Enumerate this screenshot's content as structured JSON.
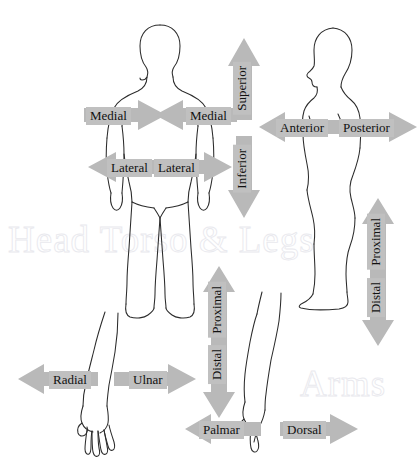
{
  "diagram": {
    "watermarks": [
      {
        "id": "head-torso-legs",
        "text": "Head Torso & Legs"
      },
      {
        "id": "arms",
        "text": "Arms"
      }
    ],
    "colors": {
      "arrow_fill": "#b9b9b9",
      "label_background": "#c0c0c0",
      "label_text": "#111111",
      "body_outline": "#2b2b2b",
      "watermark_outline": "#e9e9ee",
      "page_background": "#ffffff"
    }
  },
  "figures": [
    {
      "id": "anterior-body-figure",
      "name": "front-view-human-body",
      "view": "anterior"
    },
    {
      "id": "lateral-body-figure",
      "name": "side-view-human-body",
      "view": "lateral"
    },
    {
      "id": "left-arm-figure",
      "name": "arm-palmar-view",
      "view": "palmar"
    },
    {
      "id": "right-arm-figure",
      "name": "arm-dorsal-view",
      "view": "dorsal"
    }
  ],
  "labels": {
    "medial_left": "Medial",
    "medial_right": "Medial",
    "lateral_left": "Lateral",
    "lateral_right": "Lateral",
    "superior": "Superior",
    "inferior": "Inferior",
    "anterior": "Anterior",
    "posterior": "Posterior",
    "proximal_leg": "Proximal",
    "distal_leg": "Distal",
    "proximal_arm": "Proximal",
    "distal_arm": "Distal",
    "radial": "Radial",
    "ulnar": "Ulnar",
    "palmar": "Palmar",
    "dorsal": "Dorsal"
  },
  "arrows": [
    {
      "name": "medial-left-arrow",
      "label": "Medial",
      "direction": "right"
    },
    {
      "name": "medial-right-arrow",
      "label": "Medial",
      "direction": "left"
    },
    {
      "name": "lateral-left-arrow",
      "label": "Lateral",
      "direction": "left"
    },
    {
      "name": "lateral-right-arrow",
      "label": "Lateral",
      "direction": "right"
    },
    {
      "name": "superior-arrow",
      "label": "Superior",
      "direction": "up"
    },
    {
      "name": "inferior-arrow",
      "label": "Inferior",
      "direction": "down"
    },
    {
      "name": "anterior-arrow",
      "label": "Anterior",
      "direction": "left"
    },
    {
      "name": "posterior-arrow",
      "label": "Posterior",
      "direction": "right"
    },
    {
      "name": "leg-proximal-distal-arrow",
      "label": "Proximal / Distal",
      "direction": "up-down"
    },
    {
      "name": "arm-proximal-distal-arrow",
      "label": "Proximal / Distal",
      "direction": "up-down"
    },
    {
      "name": "radial-arrow",
      "label": "Radial",
      "direction": "left"
    },
    {
      "name": "ulnar-arrow",
      "label": "Ulnar",
      "direction": "right"
    },
    {
      "name": "palmar-arrow",
      "label": "Palmar",
      "direction": "left"
    },
    {
      "name": "dorsal-arrow",
      "label": "Dorsal",
      "direction": "right"
    }
  ]
}
